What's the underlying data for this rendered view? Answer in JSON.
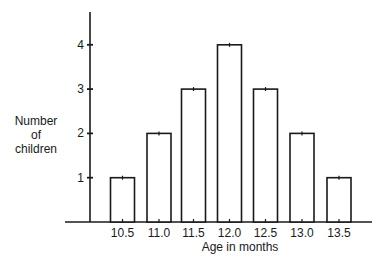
{
  "chart_data": {
    "type": "bar",
    "title": "",
    "xlabel": "Age in months",
    "ylabel": "Number of children",
    "ylabel_lines": [
      "Number",
      "of",
      "children"
    ],
    "categories": [
      "10.5",
      "11.0",
      "11.5",
      "12.0",
      "12.5",
      "13.0",
      "13.5"
    ],
    "values": [
      1,
      2,
      3,
      4,
      3,
      2,
      1
    ],
    "yticks": [
      "1",
      "2",
      "3",
      "4"
    ],
    "ylim": [
      0,
      5
    ],
    "grid": false,
    "legend": null,
    "colors": {
      "bar_fill": "#ffffff",
      "bar_stroke": "#1a1a1a",
      "axis": "#1a1a1a"
    }
  }
}
